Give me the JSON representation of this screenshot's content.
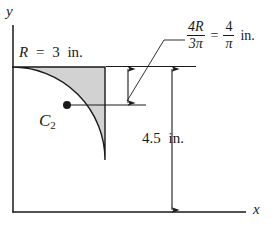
{
  "figure": {
    "axes": {
      "x_label": "x",
      "y_label": "y"
    },
    "shape": {
      "name": "quarter-circle",
      "fill_color": "#d2d2d2",
      "stroke_color": "#1a1a1a"
    },
    "centroid": {
      "label": "C",
      "subscript": "2"
    },
    "labels": {
      "radius": {
        "var": "R",
        "eq": "=",
        "value": "3",
        "unit": "in."
      },
      "height": {
        "value": "4.5",
        "unit": "in."
      }
    },
    "formula": {
      "numerator_left": "4R",
      "denominator_left": "3π",
      "equals": "=",
      "numerator_right": "4",
      "denominator_right": "π",
      "unit": "in."
    }
  }
}
